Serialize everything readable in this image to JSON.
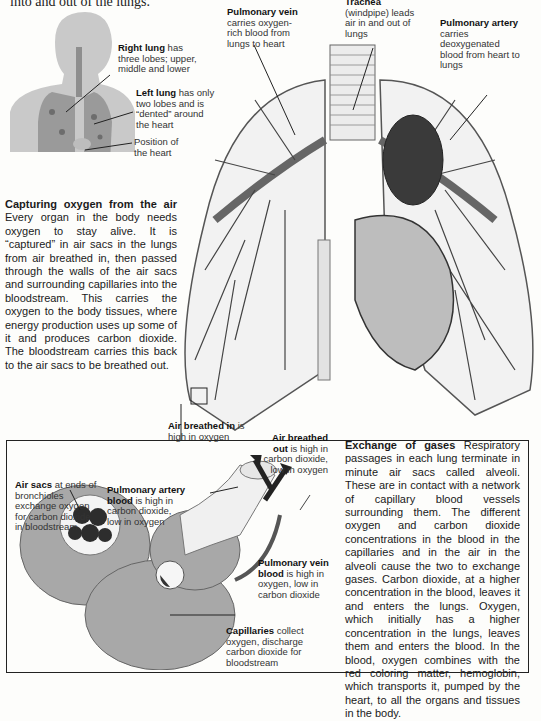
{
  "header": {
    "cut_text": "into and out of the lungs."
  },
  "figure_labels": {
    "right_lung": {
      "title": "Right lung",
      "text": "has three lobes; upper, middle and lower"
    },
    "left_lung": {
      "title": "Left lung",
      "text": "has only two lobes and is “dented” around the heart"
    },
    "heart_position": {
      "text": "Position of the heart"
    },
    "pulmonary_vein": {
      "title": "Pulmonary vein",
      "text": "carries oxygen-rich blood from lungs to heart"
    },
    "trachea": {
      "title": "Trachea",
      "text": "(windpipe) leads air in and out of lungs"
    },
    "pulmonary_artery": {
      "title": "Pulmonary artery",
      "text": "carries deoxygenated blood from heart to lungs"
    }
  },
  "capturing": {
    "title": "Capturing oxygen from the air",
    "body": "Every organ in the body needs oxygen to stay alive. It is “captured” in air sacs in the lungs from air breathed in, then passed through the walls of the air sacs and surrounding capillaries into the bloodstream. This carries the oxygen to the body tissues, where energy production uses up some of it and produces carbon dioxide. The bloodstream carries this back to the air sacs to be breathed out."
  },
  "inset_labels": {
    "air_in": {
      "title": "Air breathed in",
      "text": "is high in oxygen"
    },
    "air_out": {
      "title": "Air breathed out",
      "text": "is high in carbon dioxide, low in oxygen"
    },
    "air_sacs": {
      "title": "Air sacs",
      "text": "at ends of bronchioles exchange oxygen for carbon dioxide in bloodstream"
    },
    "pa_blood": {
      "title": "Pulmonary artery blood",
      "text": "is high in carbon dioxide, low in oxygen"
    },
    "pv_blood": {
      "title": "Pulmonary vein blood",
      "text": "is high in oxygen, low in carbon dioxide"
    },
    "capillaries": {
      "title": "Capillaries",
      "text": "collect oxygen, discharge carbon dioxide for bloodstream"
    }
  },
  "exchange": {
    "title": "Exchange of gases",
    "body": "Respiratory passages in each lung terminate in minute air sacs called alveoli. These are in contact with a network of capillary blood vessels surrounding them. The different oxygen and carbon dioxide concentrations in the blood in the capillaries and in the air in the alveoli cause the two to exchange gases. Carbon dioxide, at a higher concentration in the blood, leaves it and enters the lungs. Oxygen, which initially has a higher concentration in the lungs, leaves them and enters the blood. In the blood, oxygen combines with the red coloring matter, hemoglobin, which transports it, pumped by the heart, to all the organs and tissues in the body."
  }
}
